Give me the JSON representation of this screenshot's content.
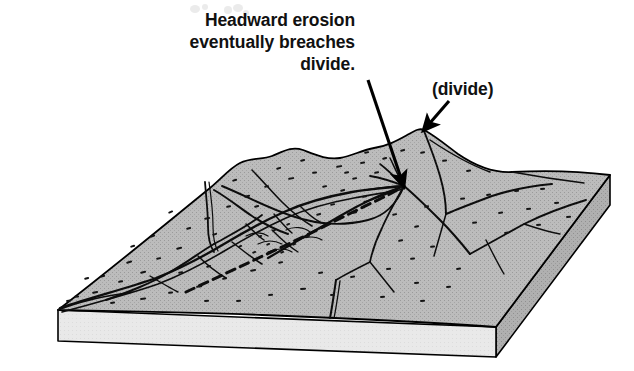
{
  "figure": {
    "type": "geologic-block-diagram",
    "background_color": "#ffffff"
  },
  "annotations": {
    "main_caption": {
      "name": "headward-erosion-caption",
      "lines": [
        "Headward erosion",
        "eventually breaches",
        "divide."
      ],
      "line1": "Headward erosion",
      "line2": "eventually breaches",
      "line3": "divide.",
      "text_color": "#111111",
      "arrow": {
        "name": "breach-pointer-arrow",
        "from_x": 368,
        "from_y": 80,
        "to_x": 404,
        "to_y": 187
      }
    },
    "divide_label": {
      "name": "divide-label",
      "text": "(divide)",
      "text_color": "#111111",
      "arrow": {
        "name": "divide-pointer-arrow",
        "from_x": 449,
        "from_y": 101,
        "to_x": 423,
        "to_y": 131
      }
    }
  },
  "block": {
    "name": "terrain-block",
    "top_surface_color": "#b5b5b5",
    "front_face_color": "#e9e9e9",
    "right_face_color": "#ababab",
    "outline_color": "#000000",
    "stipple_color": "#1a1a1a",
    "features": {
      "main_valley": "main river valley trending from lower-left corner to upper-right",
      "divide_ridge": "dashed ridge crest line crossing the block diagonally",
      "breach_point": "point where headward erosion breaches the divide",
      "tributaries": "dendritic tributary stream channels on both sides of the divide"
    }
  }
}
